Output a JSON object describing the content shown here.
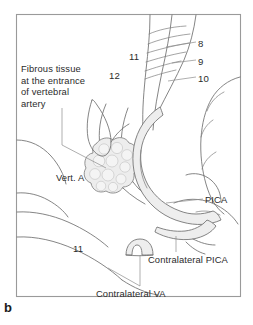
{
  "figure": {
    "panel_letter": "b",
    "background_color": "#ffffff",
    "frame_color": "#9a9a9a",
    "line_color": "#6f6f6f",
    "text_color": "#2b2b2b",
    "vessel_shade_color": "#eeeeee",
    "mass_shade_color": "#ededed"
  },
  "labels": {
    "fibrous_tissue": "Fibrous tissue\nat the entrance\nof vertebral\nartery",
    "vertebral_artery": "Vert. A",
    "nerve_11_upper": "11",
    "nerve_12": "12",
    "nerve_8": "8",
    "nerve_9": "9",
    "nerve_10": "10",
    "pica": "PICA",
    "nerve_11_lower": "11",
    "contralateral_pica": "Contralateral PICA",
    "contralateral_va": "Contralateral VA"
  }
}
